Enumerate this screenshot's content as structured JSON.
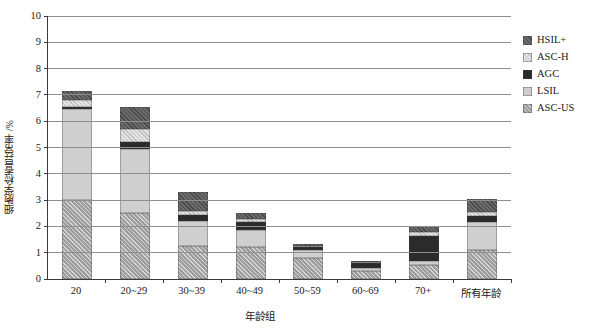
{
  "chart_data": {
    "type": "bar",
    "subtype": "stacked-bar",
    "title": "",
    "xlabel": "年龄组",
    "ylabel": "细胞学检查异常率 /%",
    "ylim": [
      0,
      10
    ],
    "ytick_step": 1,
    "yticks": [
      "10",
      "9",
      "8",
      "7",
      "6",
      "5",
      "4",
      "3",
      "2",
      "1",
      "0"
    ],
    "grid": true,
    "legend_position": "right",
    "categories": [
      "20",
      "20~29",
      "30~39",
      "40~49",
      "50~59",
      "60~69",
      "70+",
      "所有年龄"
    ],
    "series": [
      {
        "name": "ASC-US",
        "color": "#9e9e9e",
        "pattern": "diagonal-hatch",
        "values": [
          3.0,
          2.5,
          1.25,
          1.2,
          0.8,
          0.3,
          0.55,
          1.1
        ]
      },
      {
        "name": "LSIL",
        "color": "#cfcfcf",
        "pattern": "solid",
        "values": [
          3.45,
          2.45,
          0.95,
          0.65,
          0.3,
          0.12,
          0.15,
          1.05
        ]
      },
      {
        "name": "AGC",
        "color": "#2b2b2b",
        "pattern": "solid",
        "values": [
          0.1,
          0.25,
          0.25,
          0.3,
          0.1,
          0.18,
          0.95,
          0.25
        ]
      },
      {
        "name": "ASC-H",
        "color": "#e3e3e3",
        "pattern": "light-hatch",
        "values": [
          0.25,
          0.5,
          0.15,
          0.15,
          0.05,
          0.03,
          0.15,
          0.15
        ]
      },
      {
        "name": "HSIL+",
        "color": "#6a6a6a",
        "pattern": "dark-hatch",
        "values": [
          0.35,
          0.85,
          0.7,
          0.2,
          0.1,
          0.07,
          0.2,
          0.5
        ]
      }
    ],
    "totals": [
      7.15,
      6.55,
      3.3,
      2.5,
      1.35,
      0.7,
      2.0,
      3.05
    ]
  },
  "legend": {
    "items": [
      {
        "label": "HSIL+"
      },
      {
        "label": "ASC-H"
      },
      {
        "label": "AGC"
      },
      {
        "label": "LSIL"
      },
      {
        "label": "ASC-US"
      }
    ]
  }
}
